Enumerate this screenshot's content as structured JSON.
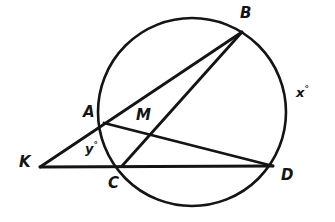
{
  "figure": {
    "kind": "circle-geometry-diagram",
    "background_color": "#ffffff",
    "stroke_color": "#141414",
    "width": 335,
    "height": 222
  },
  "circle": {
    "name": "main-circle",
    "center_x": 192,
    "center_y": 112,
    "radius": 94,
    "stroke_width": 2.6
  },
  "points": {
    "A": {
      "label": "A",
      "x": 104,
      "y": 123,
      "label_x": 83,
      "label_y": 105,
      "on_circle": true
    },
    "B": {
      "label": "B",
      "x": 242,
      "y": 32,
      "label_x": 240,
      "label_y": 6,
      "on_circle": true
    },
    "C": {
      "label": "C",
      "x": 122,
      "y": 166,
      "label_x": 108,
      "label_y": 176,
      "on_circle": true
    },
    "D": {
      "label": "D",
      "x": 273,
      "y": 166,
      "label_x": 281,
      "label_y": 168,
      "on_circle": true
    },
    "K": {
      "label": "K",
      "x": 40,
      "y": 167,
      "label_x": 19,
      "label_y": 155,
      "on_circle": false
    },
    "M": {
      "label": "M",
      "x": 150,
      "y": 133,
      "label_x": 136,
      "label_y": 108,
      "on_circle": false
    }
  },
  "segments": [
    {
      "name": "segment-K-B",
      "from": "K",
      "to": "B",
      "through": "A",
      "stroke_width": 2.8
    },
    {
      "name": "segment-K-D",
      "from": "K",
      "to": "D",
      "through": "C",
      "stroke_width": 2.8
    },
    {
      "name": "segment-A-D",
      "from": "A",
      "to": "D",
      "through": "M",
      "stroke_width": 2.8
    },
    {
      "name": "segment-C-B",
      "from": "C",
      "to": "B",
      "through": "M",
      "stroke_width": 2.8
    }
  ],
  "angles": {
    "x": {
      "text": "x",
      "degree_symbol": "°",
      "x": 296,
      "y": 85,
      "describes": "arc-BD"
    },
    "y": {
      "text": "y",
      "degree_symbol": "°",
      "x": 85,
      "y": 141,
      "describes": "angle-at-K"
    }
  }
}
